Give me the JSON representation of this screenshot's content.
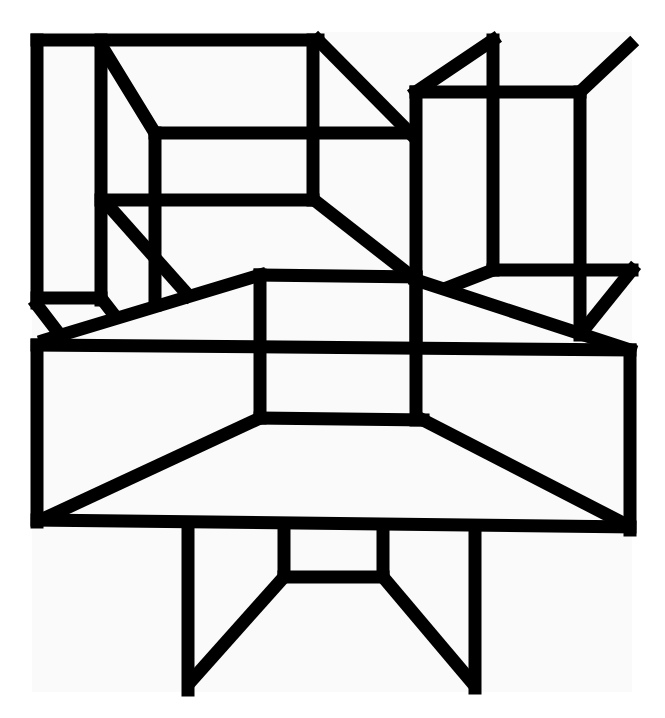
{
  "artwork": {
    "description": "Abstract black line drawing of interlocking perspective boxes and a table-like form",
    "background_color": "#fafafa",
    "line_color": "#000000",
    "groups": [
      {
        "name": "left-tall-box",
        "label": "Left tall box"
      },
      {
        "name": "upper-left-cube",
        "label": "Upper left open cube"
      },
      {
        "name": "right-tall-box",
        "label": "Right tall box"
      },
      {
        "name": "right-cube",
        "label": "Right open cube"
      },
      {
        "name": "central-slab",
        "label": "Central slab with trapezoid"
      },
      {
        "name": "center-box",
        "label": "Center raised box"
      },
      {
        "name": "lower-legs",
        "label": "Lower legs / stand"
      }
    ]
  }
}
